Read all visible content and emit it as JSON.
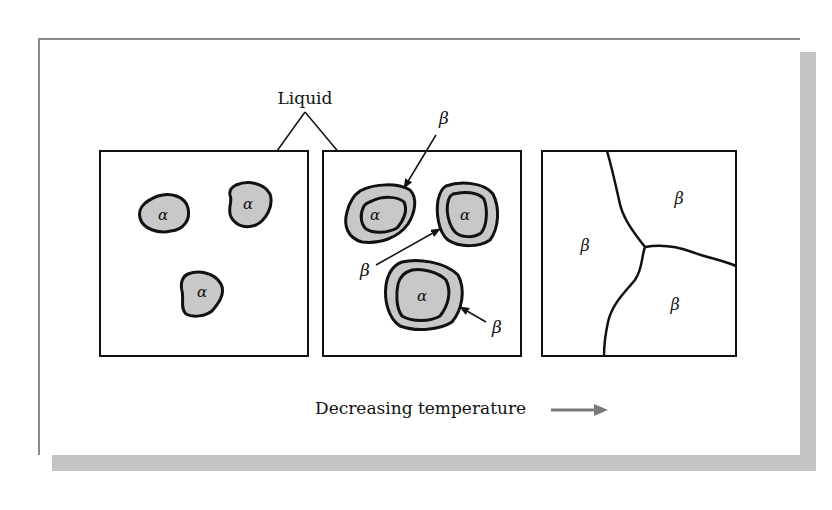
{
  "figure": {
    "caption_arrow_label": "Decreasing temperature",
    "top_label": "Liquid",
    "colors": {
      "grain_fill": "#c8c8c8",
      "outline": "#111111",
      "shadow": "#c4c4c4",
      "arrow": "#7a7a7a"
    },
    "panels": [
      {
        "id": "panel-1",
        "description": "alpha particles in liquid",
        "labels": [
          "α",
          "α",
          "α"
        ]
      },
      {
        "id": "panel-2",
        "description": "beta forming around alpha particles",
        "labels": [
          "α",
          "α",
          "α"
        ],
        "pointer_labels": [
          "β",
          "β",
          "β"
        ]
      },
      {
        "id": "panel-3",
        "description": "solid beta grains",
        "labels": [
          "β",
          "β",
          "β"
        ]
      }
    ]
  }
}
